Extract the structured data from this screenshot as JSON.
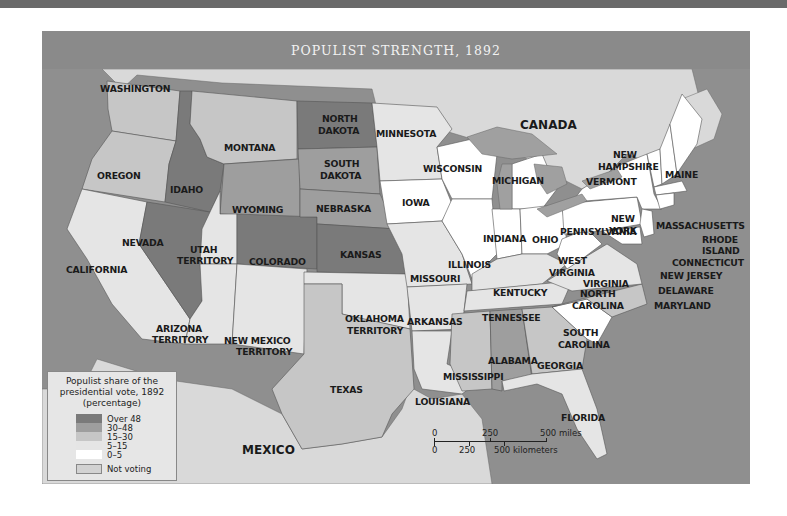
{
  "title": "POPULIST STRENGTH, 1892",
  "colors": {
    "over_48": "#7a7a7a",
    "30_48": "#9e9e9e",
    "15_30": "#c6c6c6",
    "5_15": "#e5e5e5",
    "0_5": "#ffffff",
    "not_voting": "#d2d2d2",
    "water": "#8c8c8c",
    "foreign_land": "#d9d9d9",
    "lakes": "#a0a0a0"
  },
  "legend": {
    "title_line1": "Populist share of the",
    "title_line2": "presidential vote, 1892",
    "title_line3": "(percentage)",
    "items": [
      {
        "label": "Over 48",
        "color": "#7a7a7a"
      },
      {
        "label": "30–48",
        "color": "#9e9e9e"
      },
      {
        "label": "15–30",
        "color": "#c6c6c6"
      },
      {
        "label": "5–15",
        "color": "#e5e5e5"
      },
      {
        "label": "0–5",
        "color": "#ffffff"
      }
    ],
    "not_voting": {
      "label": "Not voting",
      "color": "#d2d2d2"
    }
  },
  "scale": {
    "miles_0": "0",
    "miles_250": "250",
    "miles_500": "500 miles",
    "km_0": "0",
    "km_250": "250",
    "km_500": "500 kilometers"
  },
  "countries": {
    "canada": "CANADA",
    "mexico": "MEXICO"
  },
  "states": {
    "washington": "WASHINGTON",
    "oregon": "OREGON",
    "california": "CALIFORNIA",
    "nevada": "NEVADA",
    "idaho": "IDAHO",
    "montana": "MONTANA",
    "wyoming": "WYOMING",
    "utah_1": "UTAH",
    "utah_2": "TERRITORY",
    "colorado": "COLORADO",
    "arizona_1": "ARIZONA",
    "arizona_2": "TERRITORY",
    "new_mexico_1": "NEW MEXICO",
    "new_mexico_2": "TERRITORY",
    "north_dakota_1": "NORTH",
    "north_dakota_2": "DAKOTA",
    "south_dakota_1": "SOUTH",
    "south_dakota_2": "DAKOTA",
    "nebraska": "NEBRASKA",
    "kansas": "KANSAS",
    "oklahoma_1": "OKLAHOMA",
    "oklahoma_2": "TERRITORY",
    "texas": "TEXAS",
    "minnesota": "MINNESOTA",
    "iowa": "IOWA",
    "missouri": "MISSOURI",
    "arkansas": "ARKANSAS",
    "louisiana": "LOUISIANA",
    "wisconsin": "WISCONSIN",
    "illinois": "ILLINOIS",
    "michigan": "MICHIGAN",
    "indiana": "INDIANA",
    "ohio": "OHIO",
    "kentucky": "KENTUCKY",
    "tennessee": "TENNESSEE",
    "mississippi": "MISSISSIPPI",
    "alabama": "ALABAMA",
    "georgia": "GEORGIA",
    "florida": "FLORIDA",
    "south_carolina_1": "SOUTH",
    "south_carolina_2": "CAROLINA",
    "north_carolina_1": "NORTH",
    "north_carolina_2": "CAROLINA",
    "virginia": "VIRGINIA",
    "west_virginia_1": "WEST",
    "west_virginia_2": "VIRGINIA",
    "pennsylvania": "PENNSYLVANIA",
    "new_york_1": "NEW",
    "new_york_2": "YORK",
    "vermont": "VERMONT",
    "new_hampshire_1": "NEW",
    "new_hampshire_2": "HAMPSHIRE",
    "maine": "MAINE",
    "massachusetts": "MASSACHUSETTS",
    "rhode_island_1": "RHODE",
    "rhode_island_2": "ISLAND",
    "connecticut": "CONNECTICUT",
    "new_jersey": "NEW JERSEY",
    "delaware": "DELAWARE",
    "maryland": "MARYLAND"
  }
}
